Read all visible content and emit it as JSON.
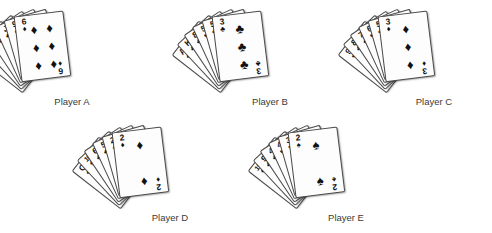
{
  "figure": {
    "background_color": "#ffffff",
    "card_face_color": "#fdfdfd",
    "card_border_color": "#4a4a4a",
    "pip_color": "#111111",
    "label_color": "#3a3a3a"
  },
  "suit_glyphs": {
    "spade": "♠",
    "heart": "♥",
    "diamond": "♦",
    "club": "♣"
  },
  "hands": [
    {
      "label": "Player A",
      "position": {
        "left": 14,
        "top": 14
      },
      "label_position": {
        "left": 12,
        "top": 96,
        "width": 120
      },
      "cards": [
        {
          "rank": "A",
          "suit": "spade",
          "suit_glyph": "♠"
        },
        {
          "rank": "A",
          "suit": "club",
          "suit_glyph": "♣"
        },
        {
          "rank": "Q",
          "suit": "diamond",
          "suit_glyph": "♦"
        },
        {
          "rank": "J",
          "suit": "club",
          "suit_glyph": "♣"
        },
        {
          "rank": "9",
          "suit": "spade",
          "suit_glyph": "♠"
        },
        {
          "rank": "6",
          "suit": "diamond",
          "suit_glyph": "♦"
        }
      ],
      "face_card": {
        "rank": "6",
        "suit": "diamond",
        "suit_glyph": "♦",
        "pip_count": 6,
        "pip_layout": "cols2"
      }
    },
    {
      "label": "Player B",
      "position": {
        "left": 212,
        "top": 14
      },
      "label_position": {
        "left": 210,
        "top": 96,
        "width": 120
      },
      "cards": [
        {
          "rank": "A",
          "suit": "spade",
          "suit_glyph": "♠"
        },
        {
          "rank": "K",
          "suit": "club",
          "suit_glyph": "♣"
        },
        {
          "rank": "8",
          "suit": "club",
          "suit_glyph": "♣"
        },
        {
          "rank": "5",
          "suit": "heart",
          "suit_glyph": "♥"
        },
        {
          "rank": "5",
          "suit": "club",
          "suit_glyph": "♣"
        },
        {
          "rank": "3",
          "suit": "club",
          "suit_glyph": "♣"
        }
      ],
      "face_card": {
        "rank": "3",
        "suit": "club",
        "suit_glyph": "♣",
        "pip_count": 3,
        "pip_layout": "cols1"
      }
    },
    {
      "label": "Player C",
      "position": {
        "left": 378,
        "top": 14
      },
      "label_position": {
        "left": 374,
        "top": 96,
        "width": 120
      },
      "cards": [
        {
          "rank": "9",
          "suit": "heart",
          "suit_glyph": "♥"
        },
        {
          "rank": "8",
          "suit": "club",
          "suit_glyph": "♣"
        },
        {
          "rank": "7",
          "suit": "spade",
          "suit_glyph": "♠"
        },
        {
          "rank": "6",
          "suit": "heart",
          "suit_glyph": "♥"
        },
        {
          "rank": "5",
          "suit": "club",
          "suit_glyph": "♣"
        },
        {
          "rank": "3",
          "suit": "diamond",
          "suit_glyph": "♦"
        }
      ],
      "face_card": {
        "rank": "3",
        "suit": "diamond",
        "suit_glyph": "♦",
        "pip_count": 3,
        "pip_layout": "cols1"
      }
    },
    {
      "label": "Player D",
      "position": {
        "left": 112,
        "top": 130
      },
      "label_position": {
        "left": 110,
        "top": 212,
        "width": 120
      },
      "cards": [
        {
          "rank": "Q",
          "suit": "spade",
          "suit_glyph": "♠"
        },
        {
          "rank": "10",
          "suit": "spade",
          "suit_glyph": "♠"
        },
        {
          "rank": "6",
          "suit": "club",
          "suit_glyph": "♣"
        },
        {
          "rank": "5",
          "suit": "club",
          "suit_glyph": "♣"
        },
        {
          "rank": "2",
          "suit": "spade",
          "suit_glyph": "♠"
        },
        {
          "rank": "2",
          "suit": "diamond",
          "suit_glyph": "♦"
        }
      ],
      "face_card": {
        "rank": "2",
        "suit": "diamond",
        "suit_glyph": "♦",
        "pip_count": 2,
        "pip_layout": "two"
      }
    },
    {
      "label": "Player E",
      "position": {
        "left": 288,
        "top": 130
      },
      "label_position": {
        "left": 286,
        "top": 212,
        "width": 120
      },
      "cards": [
        {
          "rank": "10",
          "suit": "diamond",
          "suit_glyph": "♦"
        },
        {
          "rank": "9",
          "suit": "club",
          "suit_glyph": "♣"
        },
        {
          "rank": "4",
          "suit": "club",
          "suit_glyph": "♣"
        },
        {
          "rank": "4",
          "suit": "heart",
          "suit_glyph": "♥"
        },
        {
          "rank": "3",
          "suit": "heart",
          "suit_glyph": "♥"
        },
        {
          "rank": "2",
          "suit": "spade",
          "suit_glyph": "♠"
        }
      ],
      "face_card": {
        "rank": "2",
        "suit": "spade",
        "suit_glyph": "♠",
        "pip_count": 2,
        "pip_layout": "two"
      }
    }
  ]
}
